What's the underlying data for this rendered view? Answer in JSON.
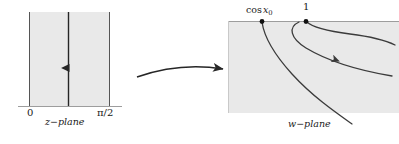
{
  "figure": {
    "type": "conformal-mapping-diagram",
    "background": "#ffffff",
    "shade_color": "#e9e9e9",
    "curve_color": "#3b3b3b",
    "axis_color": "#9a9a9a",
    "text_color": "#1a1a1a"
  },
  "left_panel": {
    "caption": "z−plane",
    "region_label": "vertical-strip",
    "axis_ticks": [
      {
        "id": "origin",
        "label": "0",
        "x_px": 30
      },
      {
        "id": "pi-over-two",
        "label": "π/2",
        "x_px": 110
      }
    ],
    "strip": {
      "x_left_px": 29,
      "x_right_px": 110,
      "y_top_px": 12,
      "y_bottom_px": 106
    },
    "ray": {
      "name": "vertical-ray",
      "x_px": 68,
      "y_start_px": 106,
      "y_end_px": 12,
      "arrow_y_px": 71,
      "direction": "up"
    }
  },
  "map_arrow": {
    "name": "mapping-arrow",
    "direction": "right",
    "from_px": [
      136,
      75
    ],
    "to_px": [
      226,
      68
    ]
  },
  "right_panel": {
    "caption": "w−plane",
    "region_label": "lower-half-plane",
    "region": {
      "x_left_px": 228,
      "x_right_px": 399,
      "y_top_px": 21,
      "y_bottom_px": 113
    },
    "points": [
      {
        "id": "cos-x0",
        "label_prefix": "cos",
        "label_var": "x",
        "label_sub": "0",
        "x_px": 262,
        "y_px": 21
      },
      {
        "id": "one",
        "label": "1",
        "x_px": 306,
        "y_px": 21
      }
    ],
    "curves": [
      {
        "id": "branch-left",
        "note": "hyperbola branch from cos x0 sweeping down-right"
      },
      {
        "id": "branch-middle",
        "note": "hyperbola branch from 1 with flow arrow",
        "arrow_px": [
          332,
          50
        ],
        "arrow_direction": "down-right"
      },
      {
        "id": "branch-upper",
        "note": "hyperbola branch from 1 bending right toward edge"
      }
    ]
  }
}
